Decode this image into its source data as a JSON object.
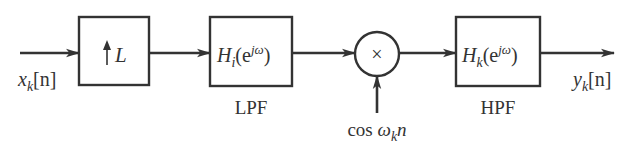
{
  "diagram": {
    "type": "signal-processing-block-diagram",
    "input": {
      "symbol": "x",
      "subscript": "k",
      "arg": "[n]"
    },
    "output": {
      "symbol": "y",
      "subscript": "k",
      "arg": "[n]"
    },
    "blocks": [
      {
        "id": "upsampler",
        "label_arrow": "↑",
        "label_var": "L",
        "caption": ""
      },
      {
        "id": "lpf",
        "label_main": "H",
        "label_sub": "i",
        "label_arg_open": "(e",
        "label_sup": "jω",
        "label_arg_close": ")",
        "caption": "LPF"
      },
      {
        "id": "hpf",
        "label_main": "H",
        "label_sub": "k",
        "label_arg_open": "(e",
        "label_sup": "jω",
        "label_arg_close": ")",
        "caption": "HPF"
      }
    ],
    "multiplier": {
      "symbol": "×",
      "side_input": {
        "prefix": "cos ",
        "var": "ω",
        "sub": "k",
        "suffix": "n"
      }
    },
    "colors": {
      "line": "#333333",
      "background": "#ffffff"
    }
  }
}
